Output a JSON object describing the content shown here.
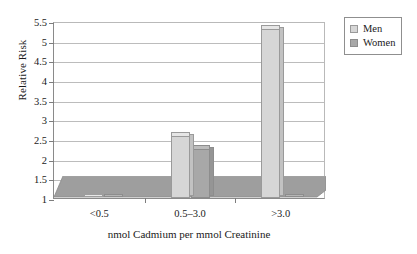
{
  "chart_data": {
    "type": "bar",
    "title": "",
    "xlabel": "nmol Cadmium per mmol Creatinine",
    "ylabel": "Relative Risk",
    "categories": [
      "<0.5",
      "0.5–3.0",
      ">3.0"
    ],
    "series": [
      {
        "name": "Men",
        "values": [
          1.0,
          2.2,
          5.3
        ],
        "color": "#d6d6d6"
      },
      {
        "name": "Women",
        "values": [
          1.0,
          1.8,
          1.0
        ],
        "color": "#a8a8a8"
      }
    ],
    "ylim": [
      1,
      5.5
    ],
    "ytick_labels": [
      "1",
      "1.5",
      "2",
      "2.5",
      "3",
      "3.5",
      "4",
      "4.5",
      "5",
      "5.5"
    ],
    "ytick_values": [
      1,
      1.5,
      2,
      2.5,
      3,
      3.5,
      4,
      4.5,
      5,
      5.5
    ],
    "grid": true,
    "legend_position": "top-right",
    "style": "3d-column"
  },
  "legend": {
    "items": [
      {
        "label": "Men"
      },
      {
        "label": "Women"
      }
    ]
  },
  "axes": {
    "y_title": "Relative Risk",
    "x_title": "nmol Cadmium per mmol Creatinine"
  },
  "colors": {
    "men": "#d6d6d6",
    "women": "#a8a8a8",
    "floor": "#9e9e9e",
    "gridline": "#bcbcbc",
    "axis": "#7d7d7d",
    "background": "#ffffff"
  }
}
